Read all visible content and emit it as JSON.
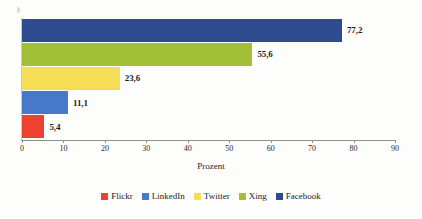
{
  "chart_data": {
    "type": "bar",
    "orientation": "horizontal",
    "title": "",
    "xlabel": "Prozent",
    "ylabel": "",
    "xlim": [
      0,
      90
    ],
    "xticks": [
      0,
      10,
      20,
      30,
      40,
      50,
      60,
      70,
      80,
      90
    ],
    "xtick_labels": [
      "0",
      "10",
      "20",
      "30",
      "40",
      "50",
      "60",
      "70",
      "80",
      "90"
    ],
    "grid": false,
    "legend_position": "bottom",
    "decimal_separator": ",",
    "categories": [
      "Facebook",
      "Xing",
      "Twitter",
      "LinkedIn",
      "Flickr"
    ],
    "values": [
      77.2,
      55.6,
      23.6,
      11.1,
      5.4
    ],
    "value_labels": [
      "77,2",
      "55,6",
      "23,6",
      "11,1",
      "5,4"
    ],
    "colors": [
      "#2e4b8f",
      "#9bc councils"
    ],
    "bars": [
      {
        "category": "Facebook",
        "value": 77.2,
        "label": "77,2",
        "color": "#2e4b8f"
      },
      {
        "category": "Xing",
        "value": 55.6,
        "label": "55,6",
        "color": "#a2c037"
      },
      {
        "category": "Twitter",
        "value": 23.6,
        "label": "23,6",
        "color": "#f5dd55"
      },
      {
        "category": "LinkedIn",
        "value": 11.1,
        "label": "11,1",
        "color": "#4878c8"
      },
      {
        "category": "Flickr",
        "value": 5.4,
        "label": "5,4",
        "color": "#ef4130"
      }
    ],
    "legend": [
      {
        "label": "Flickr",
        "color": "#ef4130"
      },
      {
        "label": "LinkedIn",
        "color": "#4878c8"
      },
      {
        "label": "Twitter",
        "color": "#f5dd55"
      },
      {
        "label": "Xing",
        "color": "#a2c037"
      },
      {
        "label": "Facebook",
        "color": "#2e4b8f"
      }
    ]
  }
}
